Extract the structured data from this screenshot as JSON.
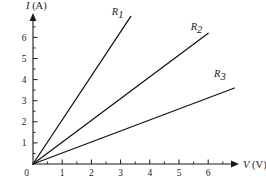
{
  "chart_data": {
    "type": "line",
    "title": "",
    "subtitle": "",
    "xlabel": "V (V)",
    "xlabel_symbol": "V",
    "xlabel_unit": "(V)",
    "ylabel": "I (A)",
    "ylabel_symbol": "I",
    "ylabel_unit": "(A)",
    "xlim": [
      0,
      7
    ],
    "ylim": [
      0,
      7
    ],
    "x_ticks": [
      1,
      2,
      3,
      4,
      5,
      6
    ],
    "x_tick_labels": [
      "1",
      "2",
      "3",
      "4",
      "5",
      "6"
    ],
    "y_ticks": [
      1,
      2,
      3,
      4,
      5,
      6
    ],
    "y_tick_labels": [
      "1",
      "2",
      "3",
      "4",
      "5",
      "6"
    ],
    "x_minor_ticks": [
      0.5,
      1.5,
      2.5,
      3.5,
      4.5,
      5.5,
      6.5
    ],
    "y_minor_ticks": [
      0.5,
      1.5,
      2.5,
      3.5,
      4.5,
      5.5,
      6.5
    ],
    "grid": false,
    "legend_position": "inline-at-line-end",
    "origin_label": "0",
    "series": [
      {
        "name": "R1",
        "label_base": "R",
        "label_sub": "1",
        "slope": 2.09,
        "points": [
          [
            0,
            0
          ],
          [
            3.35,
            7.0
          ]
        ],
        "label_at": [
          2.9,
          7.05
        ]
      },
      {
        "name": "R2",
        "label_base": "R",
        "label_sub": "2",
        "slope": 1.03,
        "points": [
          [
            0,
            0
          ],
          [
            6.0,
            6.2
          ]
        ],
        "label_at": [
          5.6,
          6.35
        ]
      },
      {
        "name": "R3",
        "label_base": "R",
        "label_sub": "3",
        "slope": 0.52,
        "points": [
          [
            0,
            0
          ],
          [
            6.9,
            3.6
          ]
        ],
        "label_at": [
          6.4,
          4.1
        ]
      }
    ]
  }
}
